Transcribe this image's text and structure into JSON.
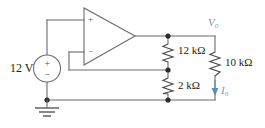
{
  "diagram": {
    "background_color": "#ffffff",
    "wire_color": "#6b6b72",
    "accent_color": "#5b8fb0"
  },
  "source": {
    "label": "12 V",
    "plus_sign": "+",
    "minus_sign": "−",
    "type": "dc-voltage-source"
  },
  "opamp": {
    "noninverting_sign": "+",
    "inverting_sign": "−"
  },
  "resistors": [
    {
      "name": "r-12k",
      "label": "12 kΩ"
    },
    {
      "name": "r-2k",
      "label": "2 kΩ"
    },
    {
      "name": "r-10k",
      "label": "10 kΩ"
    }
  ],
  "labels": {
    "vout_symbol": "V",
    "vout_subscript": "o",
    "iout_symbol": "I",
    "iout_subscript": "o"
  },
  "ground": {
    "name": "earth-ground"
  }
}
